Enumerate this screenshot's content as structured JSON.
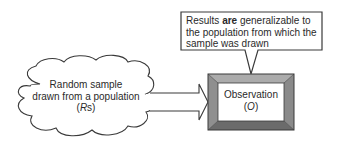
{
  "diagram": {
    "callout": {
      "line1_before": "Results ",
      "line1_bold": "are",
      "line1_after": " generalizable to",
      "line2": "the population from which the",
      "line3": "sample was drawn"
    },
    "source_cloud": {
      "line1": "Random sample",
      "line2": "drawn from a population",
      "line3_open": "(",
      "line3_italic": "R",
      "line3_after": "s)"
    },
    "arrow": {
      "direction": "right",
      "from": "source_cloud",
      "to": "observation_box"
    },
    "observation_box": {
      "line1": "Observation",
      "line2_open": "(",
      "line2_italic": "O",
      "line2_close": ")"
    },
    "colors": {
      "outline": "#3a3a3a",
      "bevel_top": "#ababab",
      "bevel_left": "#8f8f8f",
      "bevel_right": "#8a8a8a",
      "bevel_bottom": "#6b6b6b",
      "fill": "#ffffff"
    }
  }
}
